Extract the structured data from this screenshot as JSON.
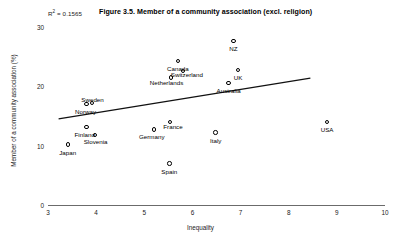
{
  "chart_data": {
    "type": "scatter",
    "title": "Figure 3.5. Member of a community association (excl. religion)",
    "r_squared_label": "R² = 0.1565",
    "r_squared_value": 0.1565,
    "xlabel": "Inequality",
    "ylabel": "Member of a community association (%)",
    "xlim": [
      3,
      10
    ],
    "ylim": [
      0,
      30
    ],
    "xticks": [
      3,
      4,
      5,
      6,
      7,
      8,
      9,
      10
    ],
    "yticks": [
      0,
      10,
      20,
      30
    ],
    "grid": false,
    "legend": "none",
    "points": [
      {
        "label": "NZ",
        "x": 6.85,
        "y": 27.6,
        "label_dx": 0,
        "label_dy": 7
      },
      {
        "label": "Canada",
        "x": 5.7,
        "y": 24.3,
        "label_dx": 0,
        "label_dy": 7
      },
      {
        "label": "Switzerland",
        "x": 5.8,
        "y": 22.6,
        "label_dx": 4,
        "label_dy": 3
      },
      {
        "label": "Netherlands",
        "x": 5.55,
        "y": 21.5,
        "label_dx": -4,
        "label_dy": 4.5
      },
      {
        "label": "UK",
        "x": 6.95,
        "y": 22.8,
        "label_dx": 0,
        "label_dy": 7
      },
      {
        "label": "Australia",
        "x": 6.75,
        "y": 20.6,
        "label_dx": 0,
        "label_dy": 7
      },
      {
        "label": "Sweden",
        "x": 3.92,
        "y": 17.2,
        "label_dx": 0,
        "label_dy": -4
      },
      {
        "label": "Norway",
        "x": 3.8,
        "y": 17.0,
        "label_dx": -1,
        "label_dy": 6.5
      },
      {
        "label": "Finland",
        "x": 3.8,
        "y": 13.1,
        "label_dx": -2,
        "label_dy": 6.5
      },
      {
        "label": "Slovenia",
        "x": 3.97,
        "y": 11.8,
        "label_dx": 1,
        "label_dy": 6.5
      },
      {
        "label": "Japan",
        "x": 3.41,
        "y": 10.2,
        "label_dx": 0,
        "label_dy": 7.5
      },
      {
        "label": "Germany",
        "x": 5.2,
        "y": 12.7,
        "label_dx": -2,
        "label_dy": 6.5
      },
      {
        "label": "France",
        "x": 5.53,
        "y": 14.0,
        "label_dx": 3,
        "label_dy": 4.5
      },
      {
        "label": "Italy",
        "x": 6.48,
        "y": 12.2,
        "label_dx": 0,
        "label_dy": 7
      },
      {
        "label": "Spain",
        "x": 5.52,
        "y": 7.0,
        "label_dx": 0,
        "label_dy": 7.5
      },
      {
        "label": "USA",
        "x": 8.8,
        "y": 14.0,
        "label_dx": 0,
        "label_dy": 7
      }
    ],
    "trendline": {
      "x_start": 3.22,
      "y_start": 14.5,
      "x_end": 8.45,
      "y_end": 21.4
    }
  }
}
